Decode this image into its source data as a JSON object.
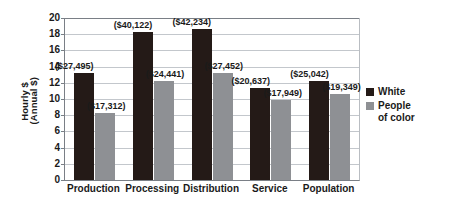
{
  "chart_data": {
    "type": "bar",
    "title": "",
    "subtitle": "",
    "xlabel": "",
    "ylabel_lines": [
      "Hourly $",
      "(Annual $)"
    ],
    "categories": [
      "Production",
      "Processing",
      "Distribution",
      "Service",
      "Population"
    ],
    "ylim": [
      0,
      20
    ],
    "ytick_labels": [
      "0",
      "2",
      "4",
      "6",
      "8",
      "10",
      "12",
      "14",
      "16",
      "18",
      "20"
    ],
    "ytick_values": [
      0,
      2,
      4,
      6,
      8,
      10,
      12,
      14,
      16,
      18,
      20
    ],
    "grid": "horizontal",
    "legend_position": "right",
    "series": [
      {
        "name": "White",
        "color": "#241a17",
        "values": [
          13.2,
          18.3,
          18.7,
          11.4,
          12.2
        ],
        "data_labels": [
          "($27,495)",
          "($40,122)",
          "($42,234)",
          "($20,637)",
          "($25,042)"
        ]
      },
      {
        "name": "People of color",
        "color": "#8e9094",
        "values": [
          8.3,
          12.2,
          13.2,
          9.9,
          10.6
        ],
        "data_labels": [
          "($17,312)",
          "($24,441)",
          "($27,452)",
          "($17,949)",
          "($19,349)"
        ]
      }
    ]
  },
  "legend": {
    "items": [
      {
        "label": "White",
        "label_line2": "",
        "color": "#241a17"
      },
      {
        "label": "People",
        "label_line2": "of color",
        "color": "#8e9094"
      }
    ]
  },
  "colors": {
    "white_series": "#241a17",
    "poc_series": "#8e9094",
    "gridline": "#c3c7cc",
    "axis": "#7a7f86",
    "text": "#1a1a1a",
    "background": "#ffffff"
  }
}
